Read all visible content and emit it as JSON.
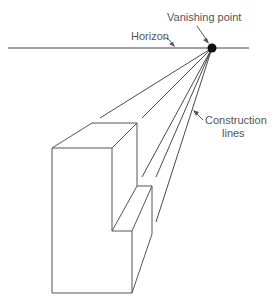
{
  "diagram": {
    "labels": {
      "vanishing_point": "Vanishing point",
      "horizon": "Horizon",
      "construction_line1": "Construction",
      "construction_line2": "lines"
    },
    "colors": {
      "line": "#555555",
      "text": "#555555",
      "point": "#111111",
      "background": "#ffffff"
    }
  }
}
